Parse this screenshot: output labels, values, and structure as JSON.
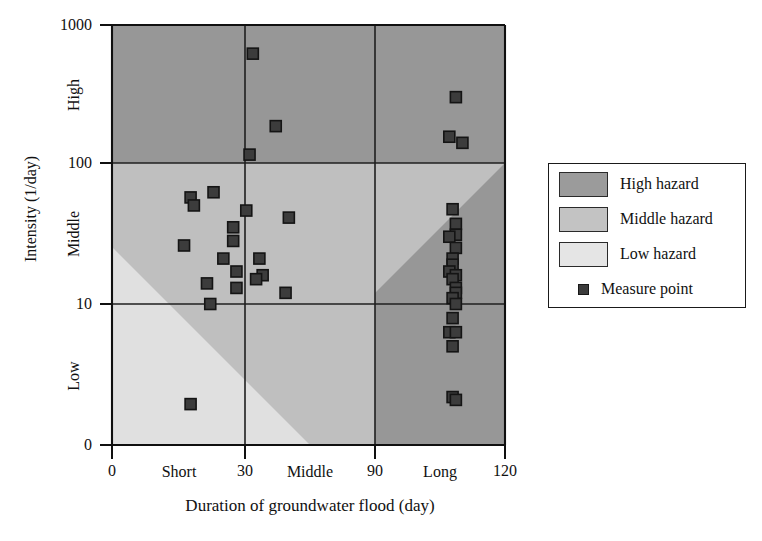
{
  "chart_data": {
    "type": "scatter",
    "title": "",
    "xlabel": "Duration of groundwater flood (day)",
    "ylabel": "Intensity (1/day)",
    "xlim": [
      0,
      120
    ],
    "ylim_labels": [
      "0",
      "10",
      "100",
      "1000"
    ],
    "x_ticks": [
      "0",
      "30",
      "90",
      "120"
    ],
    "x_tick_values": [
      0,
      30,
      90,
      120
    ],
    "y_ticks": [
      "0",
      "10",
      "100",
      "1000"
    ],
    "y_tick_values": [
      0,
      10,
      100,
      1000
    ],
    "x_band_labels": [
      "Short",
      "Middle",
      "Long"
    ],
    "y_band_labels": [
      "Low",
      "Middle",
      "High"
    ],
    "grid": true,
    "legend_position": "right-outside",
    "series": [
      {
        "name": "Measure point",
        "marker": "square",
        "color": "#3c3c3c",
        "points": [
          {
            "x": 43,
            "y": 620
          },
          {
            "x": 105,
            "y": 300
          },
          {
            "x": 50,
            "y": 185
          },
          {
            "x": 103,
            "y": 155
          },
          {
            "x": 107,
            "y": 140
          },
          {
            "x": 42,
            "y": 115
          },
          {
            "x": 31,
            "y": 62
          },
          {
            "x": 24,
            "y": 57
          },
          {
            "x": 25,
            "y": 50
          },
          {
            "x": 104,
            "y": 47
          },
          {
            "x": 41,
            "y": 46
          },
          {
            "x": 54,
            "y": 41
          },
          {
            "x": 105,
            "y": 37
          },
          {
            "x": 37,
            "y": 35
          },
          {
            "x": 105,
            "y": 31
          },
          {
            "x": 103,
            "y": 30
          },
          {
            "x": 37,
            "y": 28
          },
          {
            "x": 22,
            "y": 26
          },
          {
            "x": 105,
            "y": 25
          },
          {
            "x": 104,
            "y": 21
          },
          {
            "x": 34,
            "y": 21
          },
          {
            "x": 45,
            "y": 21
          },
          {
            "x": 104,
            "y": 19
          },
          {
            "x": 103,
            "y": 17
          },
          {
            "x": 38,
            "y": 17
          },
          {
            "x": 46,
            "y": 16
          },
          {
            "x": 105,
            "y": 16
          },
          {
            "x": 104,
            "y": 15
          },
          {
            "x": 44,
            "y": 15
          },
          {
            "x": 29,
            "y": 14
          },
          {
            "x": 105,
            "y": 13
          },
          {
            "x": 105,
            "y": 12
          },
          {
            "x": 38,
            "y": 13
          },
          {
            "x": 53,
            "y": 12
          },
          {
            "x": 104,
            "y": 11
          },
          {
            "x": 105,
            "y": 10
          },
          {
            "x": 30,
            "y": 10
          },
          {
            "x": 104,
            "y": 9
          },
          {
            "x": 103,
            "y": 8
          },
          {
            "x": 105,
            "y": 8
          },
          {
            "x": 104,
            "y": 7
          },
          {
            "x": 104,
            "y": 3.4
          },
          {
            "x": 105,
            "y": 3.2
          },
          {
            "x": 24,
            "y": 2.9
          }
        ]
      }
    ],
    "regions": [
      {
        "name": "High hazard",
        "color": "#9a9a9a"
      },
      {
        "name": "Middle hazard",
        "color": "#c2c2c2"
      },
      {
        "name": "Low hazard",
        "color": "#e4e4e4"
      }
    ]
  },
  "axes": {
    "y_title": "Intensity (1/day)",
    "x_title": "Duration of groundwater flood (day)",
    "y_ticks": [
      "1000",
      "100",
      "10",
      "0"
    ],
    "x_ticks": [
      "0",
      "30",
      "90",
      "120"
    ],
    "y_bands": [
      "High",
      "Middle",
      "Low"
    ],
    "x_bands": [
      "Short",
      "Middle",
      "Long"
    ]
  },
  "legend": {
    "items": [
      {
        "label": "High hazard",
        "kind": "swatch",
        "color": "#9a9a9a"
      },
      {
        "label": "Middle hazard",
        "kind": "swatch",
        "color": "#c2c2c2"
      },
      {
        "label": "Low hazard",
        "kind": "swatch",
        "color": "#e4e4e4"
      },
      {
        "label": "Measure point",
        "kind": "marker",
        "color": "#3c3c3c"
      }
    ]
  },
  "colors": {
    "high_hazard": "#9a9a9a",
    "middle_hazard": "#c2c2c2",
    "low_hazard": "#e4e4e4",
    "marker": "#3c3c3c",
    "axis": "#1a1a1a",
    "background": "#ffffff"
  }
}
